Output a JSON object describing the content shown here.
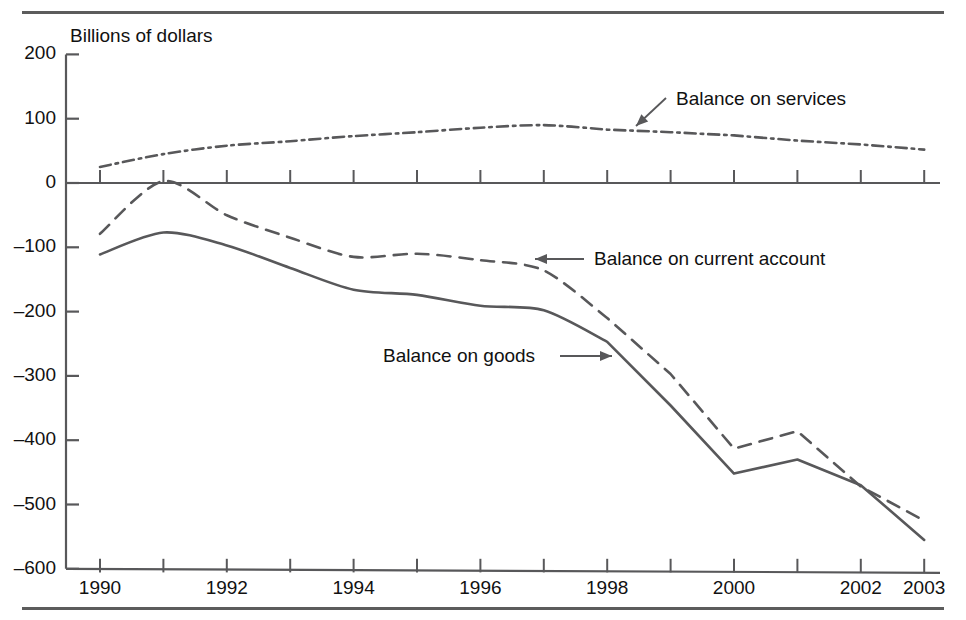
{
  "figure": {
    "axis_title": "Billions of dollars",
    "colors": {
      "line": "#58585a",
      "text": "#111111",
      "rule": "#5c5c5c"
    }
  },
  "chart_data": {
    "type": "line",
    "title": "",
    "subtitle": "",
    "xlabel": "",
    "ylabel": "Billions of dollars",
    "xlim": [
      1990,
      2003
    ],
    "ylim": [
      -600,
      200
    ],
    "yticks": [
      200,
      100,
      0,
      -100,
      -200,
      -300,
      -400,
      -500,
      -600
    ],
    "ytick_labels": [
      "200",
      "100",
      "0",
      "–100",
      "–200",
      "–300",
      "–400",
      "–500",
      "–600"
    ],
    "xticks": [
      1990,
      1991,
      1992,
      1993,
      1994,
      1995,
      1996,
      1997,
      1998,
      1999,
      2000,
      2001,
      2002,
      2003
    ],
    "xtick_labels": [
      "1990",
      "",
      "1992",
      "",
      "1994",
      "",
      "1996",
      "",
      "1998",
      "",
      "2000",
      "",
      "2002",
      "2003"
    ],
    "grid": false,
    "legend": "annotations",
    "x": [
      1990,
      1991,
      1992,
      1993,
      1994,
      1995,
      1996,
      1997,
      1998,
      1999,
      2000,
      2001,
      2002,
      2003
    ],
    "series": [
      {
        "name": "Balance on services",
        "style": "dash-dot",
        "values": [
          25,
          45,
          58,
          65,
          73,
          79,
          86,
          90,
          83,
          79,
          74,
          66,
          60,
          52
        ]
      },
      {
        "name": "Balance on current account",
        "style": "dashed",
        "values": [
          -79,
          3,
          -50,
          -85,
          -115,
          -110,
          -120,
          -136,
          -210,
          -297,
          -413,
          -386,
          -472,
          -525
        ]
      },
      {
        "name": "Balance on goods",
        "style": "solid",
        "values": [
          -111,
          -77,
          -97,
          -132,
          -166,
          -174,
          -191,
          -198,
          -247,
          -346,
          -452,
          -430,
          -470,
          -555
        ]
      }
    ],
    "annotations": [
      {
        "text": "Balance on services",
        "series": "Balance on services",
        "arrow": "down-left"
      },
      {
        "text": "Balance on current account",
        "series": "Balance on current account",
        "arrow": "left"
      },
      {
        "text": "Balance on goods",
        "series": "Balance on goods",
        "arrow": "right"
      }
    ]
  }
}
